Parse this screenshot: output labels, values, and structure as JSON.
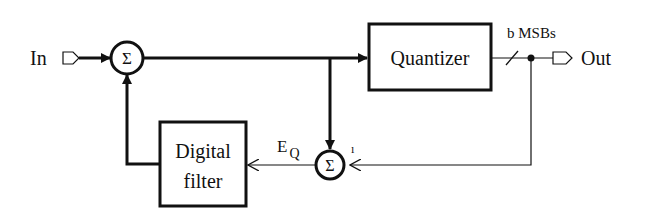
{
  "diagram": {
    "type": "block-diagram",
    "input_label": "In",
    "output_label": "Out",
    "sum_symbol": "Σ",
    "quantizer_label": "Quantizer",
    "bus_label": "b MSBs",
    "filter_label_line1": "Digital",
    "filter_label_line2": "filter",
    "error_label_main": "E",
    "error_label_sub": "Q",
    "minus_mark": "ı",
    "colors": {
      "stroke": "#111111",
      "background": "#ffffff"
    }
  }
}
